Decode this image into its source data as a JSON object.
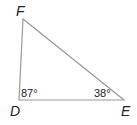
{
  "diagram": {
    "type": "triangle",
    "vertices": {
      "F": {
        "label": "F",
        "x": 23,
        "y": 19
      },
      "D": {
        "label": "D",
        "x": 19,
        "y": 100
      },
      "E": {
        "label": "E",
        "x": 124,
        "y": 100
      }
    },
    "angles": {
      "D": "87°",
      "E": "38°"
    },
    "stroke_color": "#9a9a9a",
    "text_color": "#222222"
  }
}
